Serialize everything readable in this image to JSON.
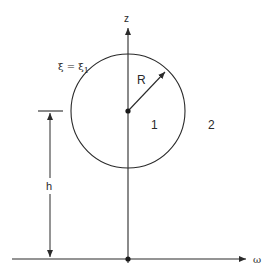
{
  "diagram": {
    "type": "geometry-schematic",
    "colors": {
      "line": "#2a2a2a",
      "background": "#ffffff"
    },
    "axes": {
      "vertical": {
        "label": "z",
        "x": 128,
        "y_top": 28,
        "y_bottom": 263
      },
      "horizontal": {
        "label": "ω",
        "y": 259,
        "x_left": 12,
        "x_right": 247
      }
    },
    "circle": {
      "center_x": 128,
      "center_y": 111,
      "radius": 57,
      "boundary_label": "ξ = ξ",
      "boundary_label_subscript": "1"
    },
    "radius_arrow": {
      "label": "R",
      "from_x": 128,
      "from_y": 111,
      "to_x": 166,
      "to_y": 71
    },
    "regions": {
      "inside": "1",
      "outside": "2"
    },
    "height_dimension": {
      "label": "h",
      "x": 50,
      "y_top": 111,
      "y_bottom": 258,
      "tick_x_left": 38,
      "tick_x_right": 63
    },
    "origin_dot": {
      "x": 128,
      "y": 259
    },
    "center_dot": {
      "x": 128,
      "y": 111
    }
  }
}
